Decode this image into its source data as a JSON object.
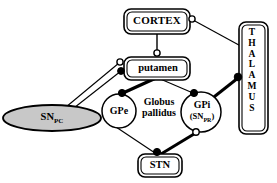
{
  "diagram": {
    "background_color": "#ffffff",
    "line_color": "#000000",
    "fill_snpc": "#c8c8c8",
    "nodes": {
      "cortex": {
        "label": "CORTEX",
        "shape": "rounded-rect-double",
        "x": 126,
        "y": 10,
        "w": 62,
        "h": 22
      },
      "putamen": {
        "label": "putamen",
        "shape": "rounded-rect-double",
        "x": 124,
        "y": 58,
        "w": 66,
        "h": 20
      },
      "stn": {
        "label": "STN",
        "shape": "rounded-rect-double",
        "x": 140,
        "y": 155,
        "w": 40,
        "h": 20
      },
      "gpe": {
        "label": "GPe",
        "shape": "circle",
        "cx": 119,
        "cy": 111,
        "r": 16
      },
      "gpi": {
        "label": "GPi",
        "sublabel_prefix": "(SN",
        "sublabel_sub": "PR",
        "sublabel_suffix": ")",
        "shape": "circle",
        "cx": 200,
        "cy": 111,
        "r": 19
      },
      "snpc": {
        "label_prefix": "SN",
        "label_sub": "PC",
        "shape": "ellipse",
        "cx": 52,
        "cy": 118,
        "rx": 48,
        "ry": 13
      },
      "thalamus": {
        "label_letters": [
          "T",
          "H",
          "A",
          "L",
          "A",
          "M",
          "U",
          "S"
        ],
        "shape": "rounded-rect-double-vertical",
        "x": 240,
        "y": 22,
        "w": 26,
        "h": 110
      }
    },
    "group_labels": {
      "globus_pallidus_line1": "Globus",
      "globus_pallidus_line2": "pallidus"
    },
    "connections": [
      {
        "id": "cortex-putamen",
        "from": "cortex",
        "to": "putamen",
        "weight": "thin",
        "terminal": "open-circle"
      },
      {
        "id": "thalamus-cortex",
        "from": "thalamus",
        "to": "cortex",
        "weight": "thin",
        "terminal": "open-circle"
      },
      {
        "id": "snpc-putamen-excitatory",
        "from": "snpc",
        "to": "putamen",
        "weight": "thin",
        "terminal": "open-circle"
      },
      {
        "id": "snpc-putamen-inhibitory",
        "from": "snpc",
        "to": "putamen",
        "weight": "thin",
        "terminal": "filled-circle"
      },
      {
        "id": "putamen-gpe",
        "from": "putamen",
        "to": "gpe",
        "weight": "thick",
        "terminal": "filled-circle"
      },
      {
        "id": "putamen-gpi",
        "from": "putamen",
        "to": "gpi",
        "weight": "thin",
        "terminal": "filled-circle"
      },
      {
        "id": "gpe-stn",
        "from": "gpe",
        "to": "stn",
        "weight": "thin",
        "terminal": "filled-circle"
      },
      {
        "id": "stn-gpi",
        "from": "stn",
        "to": "gpi",
        "weight": "thick",
        "terminal": "open-circle"
      },
      {
        "id": "gpi-thalamus",
        "from": "gpi",
        "to": "thalamus",
        "weight": "thick",
        "terminal": "filled-circle"
      }
    ]
  }
}
